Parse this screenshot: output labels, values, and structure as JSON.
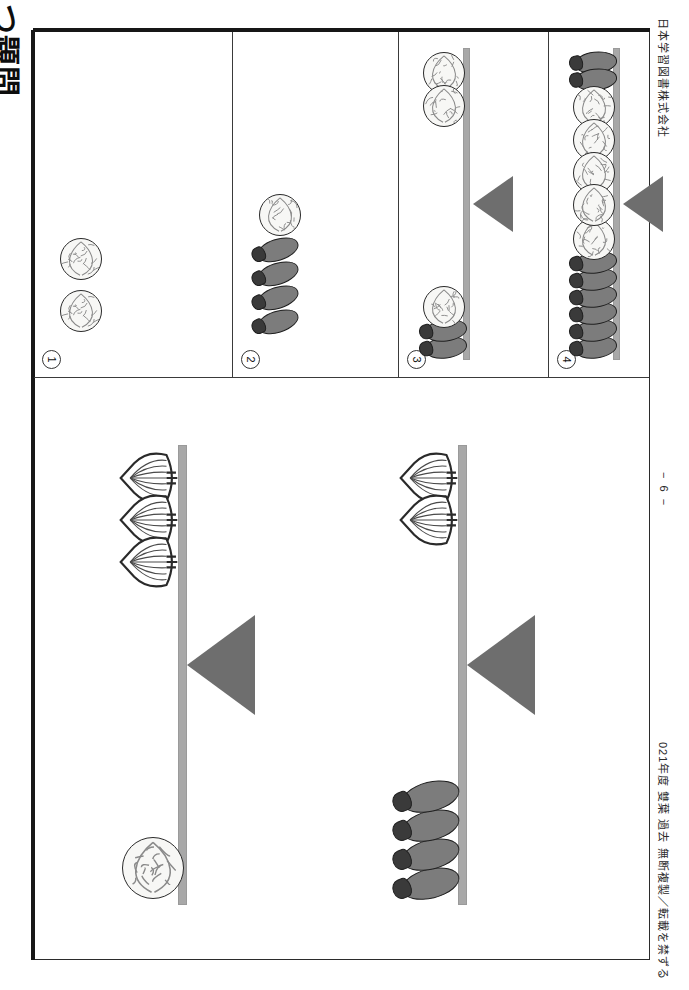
{
  "document": {
    "title": "つ題問",
    "publisher": "日本学習図書株式会社",
    "footer_note": "021年度 雙葉 過去 無断複製／転載を禁ずる",
    "page_number": "− 6 −",
    "orientation": "rotated-90"
  },
  "colors": {
    "eggplant_body": "#7c7c7c",
    "eggplant_calyx": "#3a3a3a",
    "cabbage_fill": "#f7f7f5",
    "cabbage_line": "#8a8a8a",
    "onion_fill": "#ffffff",
    "onion_line": "#2a2a2a",
    "beam": "#a8a8a8",
    "fulcrum": "#6e6e6e",
    "frame": "#2b2b2b"
  },
  "answer_panels": [
    {
      "number": "1",
      "label": "①",
      "has_balance": false,
      "items": [
        {
          "veg": "cabbage"
        },
        {
          "veg": "cabbage"
        }
      ]
    },
    {
      "number": "2",
      "label": "②",
      "has_balance": false,
      "items": [
        {
          "veg": "eggplant"
        },
        {
          "veg": "eggplant"
        },
        {
          "veg": "eggplant"
        },
        {
          "veg": "eggplant"
        },
        {
          "veg": "cabbage"
        }
      ]
    },
    {
      "number": "3",
      "label": "③",
      "has_balance": true,
      "left_pan": [
        {
          "veg": "cabbage"
        },
        {
          "veg": "cabbage"
        }
      ],
      "right_pan": [
        {
          "veg": "eggplant"
        },
        {
          "veg": "eggplant"
        },
        {
          "veg": "cabbage"
        }
      ]
    },
    {
      "number": "4",
      "label": "④",
      "has_balance": true,
      "left_pan": [
        {
          "veg": "eggplant"
        },
        {
          "veg": "eggplant"
        },
        {
          "veg": "cabbage"
        },
        {
          "veg": "cabbage"
        },
        {
          "veg": "cabbage"
        }
      ],
      "right_pan": [
        {
          "veg": "eggplant"
        },
        {
          "veg": "eggplant"
        },
        {
          "veg": "eggplant"
        },
        {
          "veg": "eggplant"
        },
        {
          "veg": "eggplant"
        },
        {
          "veg": "eggplant"
        },
        {
          "veg": "cabbage"
        },
        {
          "veg": "cabbage"
        }
      ]
    }
  ],
  "balance_scenes": [
    {
      "id": "scene-1",
      "name": "onions-vs-cabbage",
      "top_pan": [
        {
          "veg": "onion"
        },
        {
          "veg": "onion"
        },
        {
          "veg": "onion"
        }
      ],
      "bottom_pan": [
        {
          "veg": "cabbage"
        }
      ]
    },
    {
      "id": "scene-2",
      "name": "onions-vs-eggplants",
      "top_pan": [
        {
          "veg": "onion"
        },
        {
          "veg": "onion"
        }
      ],
      "bottom_pan": [
        {
          "veg": "eggplant"
        },
        {
          "veg": "eggplant"
        },
        {
          "veg": "eggplant"
        },
        {
          "veg": "eggplant"
        }
      ]
    }
  ]
}
